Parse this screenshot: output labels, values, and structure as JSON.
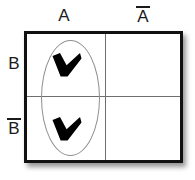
{
  "diagram": {
    "type": "karnaugh-map",
    "title": "",
    "variables": [
      "A",
      "B"
    ],
    "column_labels": [
      {
        "id": "a",
        "text": "A",
        "complement": false
      },
      {
        "id": "na",
        "text": "A",
        "complement": true
      }
    ],
    "row_labels": [
      {
        "id": "b",
        "text": "B",
        "complement": false
      },
      {
        "id": "nb",
        "text": "B",
        "complement": true
      }
    ],
    "cells": [
      {
        "id": "a-b",
        "column": "A",
        "row": "B",
        "marked": true,
        "mark": "heavy-check"
      },
      {
        "id": "na-b",
        "column": "A'",
        "row": "B",
        "marked": false,
        "mark": ""
      },
      {
        "id": "a-nb",
        "column": "A",
        "row": "B'",
        "marked": true,
        "mark": "heavy-check"
      },
      {
        "id": "na-nb",
        "column": "A'",
        "row": "B'",
        "marked": false,
        "mark": ""
      }
    ],
    "groups": [
      {
        "id": "group-a",
        "shape": "ellipse",
        "covers": [
          "a-b",
          "a-nb"
        ],
        "term": "A",
        "orientation": "vertical"
      }
    ],
    "colors": {
      "border": "#111111",
      "divider": "#6e6e6e",
      "group_outline": "#8f8f8f",
      "mark": "#000000",
      "background": "#ffffff",
      "text": "#1a1a1a"
    }
  }
}
